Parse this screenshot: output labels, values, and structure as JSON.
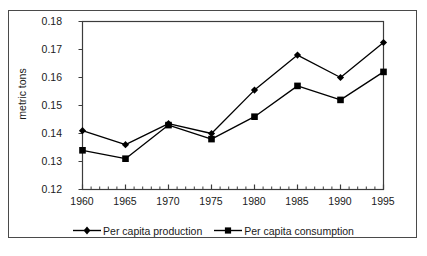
{
  "chart_data": {
    "type": "line",
    "title": "",
    "xlabel": "",
    "ylabel": "metric tons",
    "x": [
      1960,
      1965,
      1970,
      1975,
      1980,
      1985,
      1990,
      1995
    ],
    "xtick_labels": [
      "1960",
      "1965",
      "1970",
      "1975",
      "1980",
      "1985",
      "1990",
      "1995"
    ],
    "ytick_labels": [
      "0.12",
      "0.13",
      "0.14",
      "0.15",
      "0.16",
      "0.17",
      "0.18"
    ],
    "yticks": [
      0.12,
      0.13,
      0.14,
      0.15,
      0.16,
      0.17,
      0.18
    ],
    "ylim": [
      0.12,
      0.18
    ],
    "xlim": [
      1960,
      1995
    ],
    "grid": false,
    "minor_xticks": true,
    "minor_xtick_interval": 1,
    "legend_position": "bottom",
    "series": [
      {
        "name": "Per capita production",
        "marker": "diamond",
        "color": "#000000",
        "values": [
          0.141,
          0.136,
          0.1435,
          0.14,
          0.1555,
          0.168,
          0.16,
          0.1725
        ]
      },
      {
        "name": "Per capita consumption",
        "marker": "square",
        "color": "#000000",
        "values": [
          0.134,
          0.131,
          0.143,
          0.138,
          0.146,
          0.157,
          0.152,
          0.162
        ]
      }
    ]
  },
  "legend": {
    "items": [
      {
        "label": "Per capita production",
        "marker": "diamond-marker"
      },
      {
        "label": "Per capita consumption",
        "marker": "square-marker"
      }
    ]
  }
}
